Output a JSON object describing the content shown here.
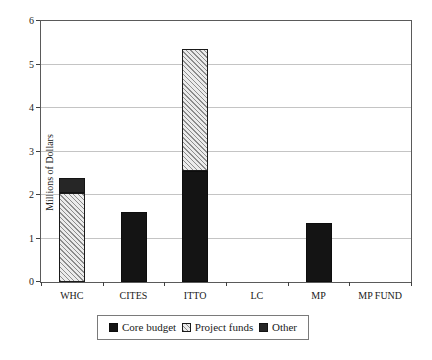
{
  "colors": {
    "core_budget": "#141414",
    "other": "#262626",
    "hatch_line": "#8c8c8c",
    "hatch_bg": "#ebebeb",
    "gridline": "#c4c4c4",
    "axis": "#5a5a5a"
  },
  "chart_data": {
    "type": "bar",
    "stacked": true,
    "title": "",
    "xlabel": "",
    "ylabel": "Millions of Dollars",
    "ylim": [
      0,
      6
    ],
    "ytick_step": 1,
    "grid": true,
    "legend_position": "bottom",
    "categories": [
      "WHC",
      "CITES",
      "ITTO",
      "LC",
      "MP",
      "MP FUND"
    ],
    "series": [
      {
        "name": "Core budget",
        "style": "solid-black",
        "values": [
          0,
          1.6,
          2.55,
          0,
          1.35,
          0
        ]
      },
      {
        "name": "Project funds",
        "style": "hatch",
        "values": [
          2.05,
          0,
          2.8,
          0,
          0,
          0
        ]
      },
      {
        "name": "Other",
        "style": "solid-dark",
        "values": [
          0.35,
          0,
          0,
          0,
          0,
          0
        ]
      }
    ],
    "totals": {
      "WHC": 2.4,
      "CITES": 1.6,
      "ITTO": 5.35,
      "LC": 0,
      "MP": 1.35,
      "MP FUND": 0
    }
  }
}
